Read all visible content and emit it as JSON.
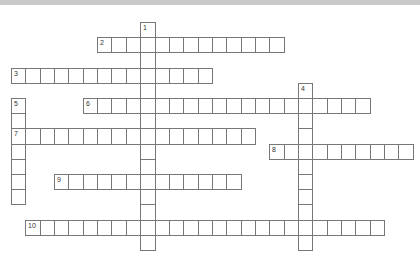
{
  "puzzle": {
    "type": "crossword",
    "grid": {
      "origin_x": 11,
      "origin_y": 22,
      "cell_w": 14.35,
      "cell_h": 15.2
    },
    "colors": {
      "border": "#777777",
      "topbar": "#c9c9c9",
      "cell_bg": "#ffffff"
    },
    "entries": [
      {
        "number": "1",
        "direction": "down",
        "row": 0,
        "col": 9,
        "length": 15
      },
      {
        "number": "2",
        "direction": "across",
        "row": 1,
        "col": 6,
        "length": 13
      },
      {
        "number": "3",
        "direction": "across",
        "row": 3,
        "col": 0,
        "length": 14
      },
      {
        "number": "4",
        "direction": "down",
        "row": 4,
        "col": 20,
        "length": 11
      },
      {
        "number": "5",
        "direction": "down",
        "row": 5,
        "col": 0,
        "length": 7
      },
      {
        "number": "6",
        "direction": "across",
        "row": 5,
        "col": 5,
        "length": 20
      },
      {
        "number": "7",
        "direction": "across",
        "row": 7,
        "col": 0,
        "length": 17
      },
      {
        "number": "8",
        "direction": "across",
        "row": 8,
        "col": 18,
        "length": 10
      },
      {
        "number": "9",
        "direction": "across",
        "row": 10,
        "col": 3,
        "length": 13
      },
      {
        "number": "10",
        "direction": "across",
        "row": 13,
        "col": 1,
        "length": 25
      }
    ]
  }
}
